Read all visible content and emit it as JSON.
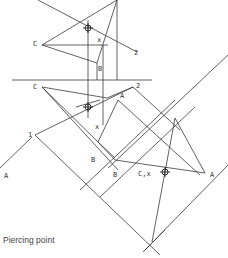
{
  "caption": "Piercing point",
  "labels": {
    "top_view": {
      "C": "C",
      "x": "x",
      "B": "B",
      "two": "2"
    },
    "front_view": {
      "C": "C",
      "A": "A",
      "two": "2",
      "x": "x",
      "B": "B",
      "one": "1"
    },
    "aux_view": {
      "A_left": "A",
      "B": "B",
      "B2": "B",
      "Cx": "C,x",
      "A_right": "A"
    }
  },
  "colors": {
    "line": "#3a3a3a",
    "background": "#ffffff",
    "text": "#333333"
  }
}
